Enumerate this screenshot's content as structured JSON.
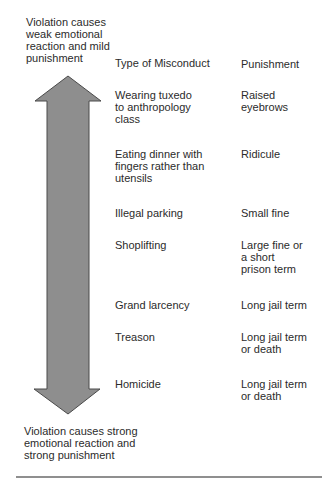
{
  "diagram": {
    "top_note": "Violation causes\nweak emotional\nreaction and mild\npunishment",
    "bottom_note": "Violation causes strong\nemotional reaction and\nstrong punishment",
    "columns": {
      "misconduct": "Type of Misconduct",
      "punishment": "Punishment"
    },
    "rows": [
      {
        "misconduct": "Wearing tuxedo\nto anthropology\nclass",
        "punishment": "Raised\neyebrows",
        "top": 89
      },
      {
        "misconduct": "Eating dinner with\nfingers rather than\nutensils",
        "punishment": "Ridicule",
        "top": 148
      },
      {
        "misconduct": "Illegal parking",
        "punishment": "Small fine",
        "top": 207
      },
      {
        "misconduct": "Shoplifting",
        "punishment": "Large fine or\na short\nprison term",
        "top": 239
      },
      {
        "misconduct": "Grand larcency",
        "punishment": "Long jail term",
        "top": 299
      },
      {
        "misconduct": "Treason",
        "punishment": "Long jail term\nor death",
        "top": 331
      },
      {
        "misconduct": "Homicide",
        "punishment": "Long jail term\nor death",
        "top": 378
      }
    ],
    "arrow": {
      "icon": "double-headed-vertical-arrow-icon",
      "fill": "#8e8e8e",
      "stroke": "#4a4a4a"
    },
    "rule_color": "#8f8f8f"
  }
}
